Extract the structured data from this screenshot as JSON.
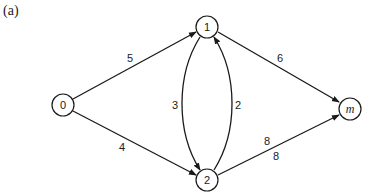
{
  "caption": "(a)",
  "diagram": {
    "type": "directed-graph",
    "nodes": [
      {
        "id": "0",
        "label": "0",
        "x": 63,
        "y": 105
      },
      {
        "id": "1",
        "label": "1",
        "x": 207,
        "y": 27
      },
      {
        "id": "2",
        "label": "2",
        "x": 207,
        "y": 180
      },
      {
        "id": "m",
        "label": "m",
        "x": 350,
        "y": 109
      }
    ],
    "edges": [
      {
        "from": "0",
        "to": "1",
        "weight": "5"
      },
      {
        "from": "0",
        "to": "2",
        "weight": "4"
      },
      {
        "from": "2",
        "to": "1",
        "weight": "3"
      },
      {
        "from": "1",
        "to": "2",
        "weight": "2"
      },
      {
        "from": "1",
        "to": "m",
        "weight": "6"
      },
      {
        "from": "2",
        "to": "m",
        "weight": "8"
      }
    ],
    "edge_labels": {
      "e01": "5",
      "e02": "4",
      "e21_left": "3",
      "e12_right": "2",
      "e1m": "6",
      "e2m_top": "8",
      "e2m_bottom": "8"
    }
  }
}
